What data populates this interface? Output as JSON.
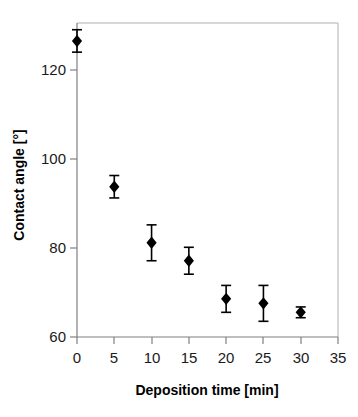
{
  "chart_data": {
    "type": "scatter",
    "title": "",
    "xlabel": "Deposition time [min]",
    "ylabel": "Contact angle [°]",
    "xlim": [
      0,
      35
    ],
    "ylim": [
      60,
      130
    ],
    "xticks": [
      0,
      5,
      10,
      15,
      20,
      25,
      30,
      35
    ],
    "xtick_labels": [
      "0",
      "5",
      "10",
      "15",
      "20",
      "25",
      "30",
      "35"
    ],
    "yticks": [
      60,
      80,
      100,
      120
    ],
    "ytick_labels": [
      "60",
      "80",
      "100",
      "120"
    ],
    "grid": false,
    "legend": false,
    "marker": "diamond",
    "marker_color": "#000000",
    "error_bars": true,
    "x": [
      0,
      5,
      10,
      15,
      20,
      25,
      30
    ],
    "values": [
      126.0,
      93.5,
      81.0,
      77.0,
      68.5,
      67.5,
      65.5
    ],
    "yerr": [
      2.5,
      2.5,
      4.0,
      3.0,
      3.0,
      4.0,
      1.2
    ],
    "series": [
      {
        "name": "Contact angle",
        "x": [
          0,
          5,
          10,
          15,
          20,
          25,
          30
        ],
        "values": [
          126.0,
          93.5,
          81.0,
          77.0,
          68.5,
          67.5,
          65.5
        ],
        "yerr": [
          2.5,
          2.5,
          4.0,
          3.0,
          3.0,
          4.0,
          1.2
        ]
      }
    ],
    "points": [
      {
        "x": 0,
        "y": 126.0,
        "err": 2.5
      },
      {
        "x": 5,
        "y": 93.5,
        "err": 2.5
      },
      {
        "x": 10,
        "y": 81.0,
        "err": 4.0
      },
      {
        "x": 15,
        "y": 77.0,
        "err": 3.0
      },
      {
        "x": 20,
        "y": 68.5,
        "err": 3.0
      },
      {
        "x": 25,
        "y": 67.5,
        "err": 4.0
      },
      {
        "x": 30,
        "y": 65.5,
        "err": 1.2
      }
    ],
    "colors": {
      "marker": "#000000",
      "error_bar": "#000000",
      "axis": "#808080",
      "frame": "#b0b0b0",
      "text": "#000000",
      "background": "#ffffff"
    }
  }
}
